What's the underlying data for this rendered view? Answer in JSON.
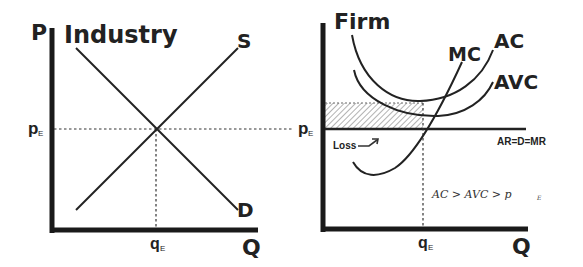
{
  "industry": {
    "title": "Industry",
    "y_axis_label": "P",
    "x_axis_label": "Q",
    "price_label": "p",
    "price_sub": "E",
    "quantity_label": "q",
    "quantity_sub": "E",
    "supply_label": "S",
    "demand_label": "D"
  },
  "firm": {
    "title": "Firm",
    "x_axis_label": "Q",
    "price_label": "p",
    "price_sub": "E",
    "quantity_label": "q",
    "quantity_sub": "E",
    "mc_label": "MC",
    "ac_label": "AC",
    "avc_label": "AVC",
    "demand_line_label": "AR=D=MR",
    "loss_label": "Loss",
    "inequality": {
      "part1": "AC > AVC > p",
      "sub": "E"
    }
  },
  "colors": {
    "ink": "#222222",
    "hatch": "#555555",
    "background": "#ffffff"
  }
}
